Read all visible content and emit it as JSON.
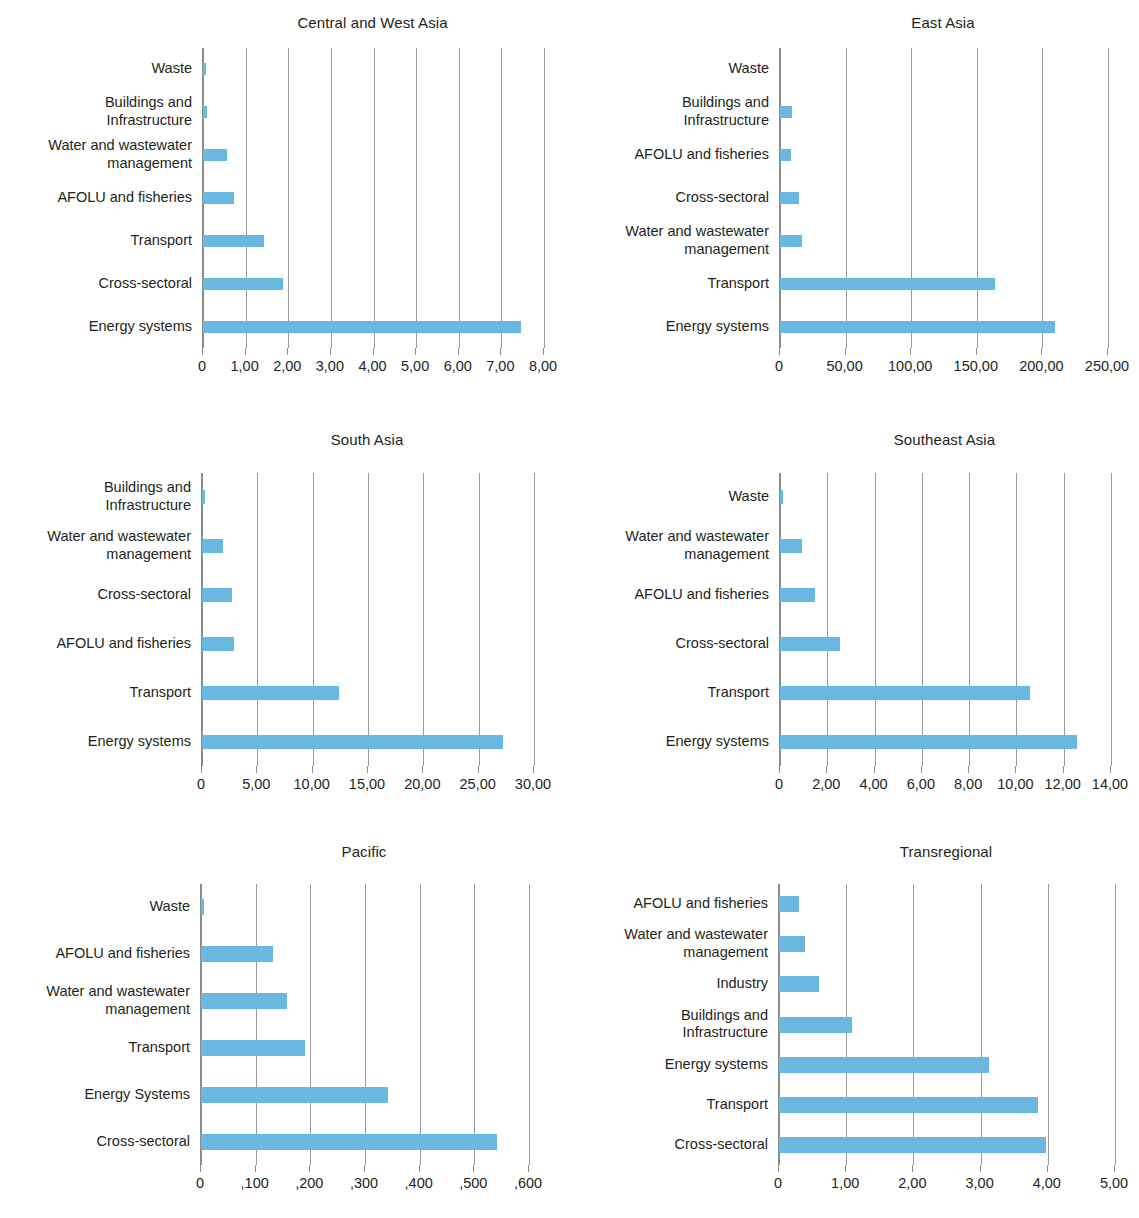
{
  "figure": {
    "panel_count": 6,
    "bar_color": "#6ab7e2",
    "gridline_color": "#9a9a9a",
    "text_color": "#231f20"
  },
  "chart_data": [
    {
      "type": "bar",
      "orientation": "horizontal",
      "title": "Central and West Asia",
      "xlabel": "",
      "ylabel": "",
      "grid": true,
      "legend": "none",
      "xlim": [
        0,
        8
      ],
      "xticks": [
        0,
        1,
        2,
        3,
        4,
        5,
        6,
        7,
        8
      ],
      "xticklabels": [
        "0",
        "1,00",
        "2,00",
        "3,00",
        "4,00",
        "5,00",
        "6,00",
        "7,00",
        "8,00"
      ],
      "categories": [
        "Waste",
        "Buildings and\nInfrastructure",
        "Water and wastewater\nmanagement",
        "AFOLU and fisheries",
        "Transport",
        "Cross-sectoral",
        "Energy systems"
      ],
      "values": [
        0.06,
        0.09,
        0.56,
        0.73,
        1.42,
        1.88,
        7.47
      ]
    },
    {
      "type": "bar",
      "orientation": "horizontal",
      "title": "East Asia",
      "xlabel": "",
      "ylabel": "",
      "grid": true,
      "legend": "none",
      "xlim": [
        0,
        250
      ],
      "xticks": [
        0,
        50,
        100,
        150,
        200,
        250
      ],
      "xticklabels": [
        "0",
        "50,00",
        "100,00",
        "150,00",
        "200,00",
        "250,00"
      ],
      "categories": [
        "Waste",
        "Buildings and\nInfrastructure",
        "AFOLU and fisheries",
        "Cross-sectoral",
        "Water and wastewater\nmanagement",
        "Transport",
        "Energy systems"
      ],
      "values": [
        0,
        9.4,
        8.2,
        14.5,
        16.6,
        163.5,
        209.7
      ]
    },
    {
      "type": "bar",
      "orientation": "horizontal",
      "title": "South Asia",
      "xlabel": "",
      "ylabel": "",
      "grid": true,
      "legend": "none",
      "xlim": [
        0,
        30
      ],
      "xticks": [
        0,
        5,
        10,
        15,
        20,
        25,
        30
      ],
      "xticklabels": [
        "0",
        "5,00",
        "10,00",
        "15,00",
        "20,00",
        "25,00",
        "30,00"
      ],
      "categories": [
        "Buildings and\nInfrastructure",
        "Water and wastewater\nmanagement",
        "Cross-sectoral",
        "AFOLU and fisheries",
        "Transport",
        "Energy systems"
      ],
      "values": [
        0.3,
        1.93,
        2.69,
        2.87,
        12.4,
        27.2
      ]
    },
    {
      "type": "bar",
      "orientation": "horizontal",
      "title": "Southeast Asia",
      "xlabel": "",
      "ylabel": "",
      "grid": true,
      "legend": "none",
      "xlim": [
        0,
        14
      ],
      "xticks": [
        0,
        2,
        4,
        6,
        8,
        10,
        12,
        14
      ],
      "xticklabels": [
        "0",
        "2,00",
        "4,00",
        "6,00",
        "8,00",
        "10,00",
        "12,00",
        "14,00"
      ],
      "categories": [
        "Waste",
        "Water and wastewater\nmanagement",
        "AFOLU and fisheries",
        "Cross-sectoral",
        "Transport",
        "Energy systems"
      ],
      "values": [
        0.14,
        0.94,
        1.5,
        2.53,
        10.56,
        12.55
      ]
    },
    {
      "type": "bar",
      "orientation": "horizontal",
      "title": "Pacific",
      "xlabel": "",
      "ylabel": "",
      "grid": true,
      "legend": "none",
      "xlim": [
        0,
        600
      ],
      "xticks": [
        0,
        100,
        200,
        300,
        400,
        500,
        600
      ],
      "xticklabels": [
        "0",
        ",100",
        ",200",
        ",300",
        ",400",
        ",500",
        ",600"
      ],
      "categories": [
        "Waste",
        "AFOLU and fisheries",
        "Water and wastewater\nmanagement",
        "Transport",
        "Energy Systems",
        "Cross-sectoral"
      ],
      "values": [
        6,
        131,
        158,
        190,
        341.6,
        541.6
      ]
    },
    {
      "type": "bar",
      "orientation": "horizontal",
      "title": "Transregional",
      "xlabel": "",
      "ylabel": "",
      "grid": true,
      "legend": "none",
      "xlim": [
        0,
        5
      ],
      "xticks": [
        0,
        1,
        2,
        3,
        4,
        5
      ],
      "xticklabels": [
        "0",
        "1,00",
        "2,00",
        "3,00",
        "4,00",
        "5,00"
      ],
      "categories": [
        "AFOLU and fisheries",
        "Water and wastewater\nmanagement",
        "Industry",
        "Buildings and\nInfrastructure",
        "Energy systems",
        "Transport",
        "Cross-sectoral"
      ],
      "values": [
        0.3,
        0.38,
        0.6,
        1.09,
        3.13,
        3.85,
        3.97
      ]
    }
  ],
  "layout": [
    {
      "title_top": 14,
      "plot_left": 202,
      "plot_right": 543,
      "plot_top": 48,
      "plot_bottom": 348,
      "bar_h": 12
    },
    {
      "title_top": 14,
      "plot_left": 779,
      "plot_right": 1107,
      "plot_top": 48,
      "plot_bottom": 348,
      "bar_h": 12
    },
    {
      "title_top": 431,
      "plot_left": 201,
      "plot_right": 533,
      "plot_top": 473,
      "plot_bottom": 766,
      "bar_h": 14
    },
    {
      "title_top": 431,
      "plot_left": 779,
      "plot_right": 1110,
      "plot_top": 473,
      "plot_bottom": 766,
      "bar_h": 14
    },
    {
      "title_top": 843,
      "plot_left": 200,
      "plot_right": 528,
      "plot_top": 884,
      "plot_bottom": 1165,
      "bar_h": 16
    },
    {
      "title_top": 843,
      "plot_left": 778,
      "plot_right": 1114,
      "plot_top": 884,
      "plot_bottom": 1165,
      "bar_h": 16
    }
  ]
}
